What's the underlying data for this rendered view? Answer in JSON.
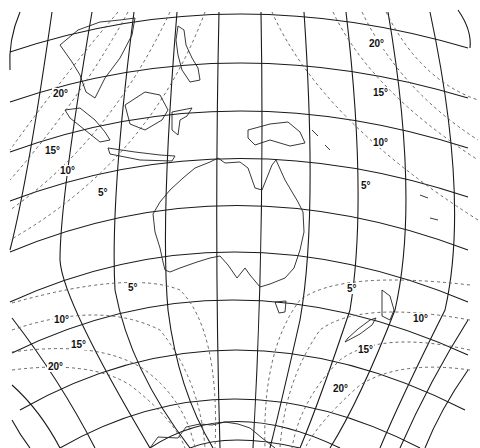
{
  "map": {
    "title": "Map projection distortion isolines — Australia / Southeast Asia / New Zealand",
    "isoline_unit": "degrees of angular distortion",
    "colors": {
      "lines": "#1a1a1a",
      "isolines": "#555555",
      "background": "#ffffff"
    },
    "labels": [
      {
        "id": "nw-20",
        "text": "20°",
        "x": 52,
        "y": 93
      },
      {
        "id": "nw-15",
        "text": "15°",
        "x": 44,
        "y": 144
      },
      {
        "id": "nw-10",
        "text": "10°",
        "x": 59,
        "y": 165
      },
      {
        "id": "nw-5",
        "text": "5°",
        "x": 97,
        "y": 187
      },
      {
        "id": "ne-20",
        "text": "20°",
        "x": 368,
        "y": 36
      },
      {
        "id": "ne-15",
        "text": "15°",
        "x": 372,
        "y": 86
      },
      {
        "id": "ne-10",
        "text": "10°",
        "x": 372,
        "y": 136
      },
      {
        "id": "ne-5",
        "text": "5°",
        "x": 360,
        "y": 179
      },
      {
        "id": "sw-5",
        "text": "5°",
        "x": 126,
        "y": 282
      },
      {
        "id": "sw-10",
        "text": "10°",
        "x": 53,
        "y": 314
      },
      {
        "id": "sw-15",
        "text": "15°",
        "x": 70,
        "y": 338
      },
      {
        "id": "sw-20",
        "text": "20°",
        "x": 47,
        "y": 358
      },
      {
        "id": "se-5",
        "text": "5°",
        "x": 346,
        "y": 282
      },
      {
        "id": "se-10",
        "text": "10°",
        "x": 412,
        "y": 313
      },
      {
        "id": "se-15",
        "text": "15°",
        "x": 357,
        "y": 343
      },
      {
        "id": "se-20",
        "text": "20°",
        "x": 332,
        "y": 382
      }
    ],
    "regions_depicted": [
      "Southeast Asia",
      "Philippines",
      "Borneo",
      "Sumatra",
      "Java",
      "New Guinea",
      "Australia",
      "Tasmania",
      "New Zealand",
      "Antarctica coast",
      "Pacific islands"
    ]
  }
}
